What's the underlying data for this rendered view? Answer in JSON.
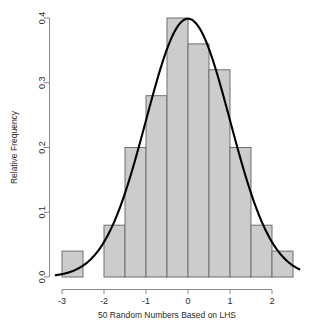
{
  "chart_data": {
    "type": "bar",
    "title": "",
    "subtitle": "",
    "xlabel": "50 Random Numbers Based on LHS",
    "ylabel": "Relative Frequency",
    "xlim": [
      -3.15,
      2.65
    ],
    "ylim": [
      0.0,
      0.4
    ],
    "grid": false,
    "legend": null,
    "bin_width": 0.5,
    "categories": [
      "[-3.0,-2.5)",
      "[-2.5,-2.0)",
      "[-2.0,-1.5)",
      "[-1.5,-1.0)",
      "[-1.0,-0.5)",
      "[-0.5,0.0)",
      "[0.0,0.5)",
      "[0.5,1.0)",
      "[1.0,1.5)",
      "[1.5,2.0)",
      "[2.0,2.5)"
    ],
    "bin_edges": [
      -3.0,
      -2.5,
      -2.0,
      -1.5,
      -1.0,
      -0.5,
      0.0,
      0.5,
      1.0,
      1.5,
      2.0,
      2.5
    ],
    "values": [
      0.04,
      0.0,
      0.08,
      0.2,
      0.28,
      0.4,
      0.36,
      0.32,
      0.2,
      0.08,
      0.04
    ],
    "xticks": [
      -3,
      -2,
      -1,
      0,
      1,
      2
    ],
    "xticklabels": [
      "-3",
      "-2",
      "-1",
      "0",
      "1",
      "2"
    ],
    "yticks": [
      0.0,
      0.1,
      0.2,
      0.3,
      0.4
    ],
    "yticklabels": [
      "0.0",
      "0.1",
      "0.2",
      "0.3",
      "0.4"
    ],
    "overlay_curve": {
      "name": "normal density",
      "mean": 0.0,
      "sd": 1.0,
      "peak_value": 0.4,
      "color": "#000000"
    },
    "colors": {
      "bar_fill": "#cccccc",
      "bar_border": "#6e6e6e",
      "curve": "#000000",
      "axis": "#8a8a8a",
      "text": "#2b2b2b",
      "background": "#ffffff"
    }
  }
}
